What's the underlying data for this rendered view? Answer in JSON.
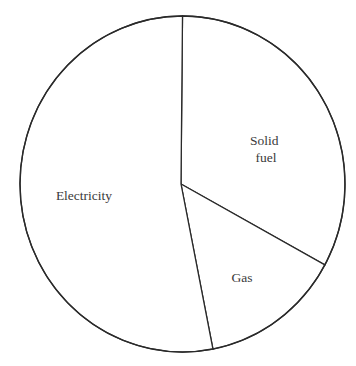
{
  "chart_data": {
    "type": "pie",
    "title": "",
    "start_angle_deg": 0,
    "direction": "clockwise",
    "categories": [
      "Solid fuel",
      "Gas",
      "Electricity"
    ],
    "values": [
      33,
      14,
      53
    ],
    "unit": "%",
    "labels": [
      {
        "lines": [
          "Solid",
          "fuel"
        ]
      },
      {
        "lines": [
          "Gas"
        ]
      },
      {
        "lines": [
          "Electricity"
        ]
      }
    ],
    "legend": "none",
    "colors": {
      "fill": "#ffffff",
      "stroke": "#2a2a2a",
      "label": "#3a3a3a"
    }
  }
}
